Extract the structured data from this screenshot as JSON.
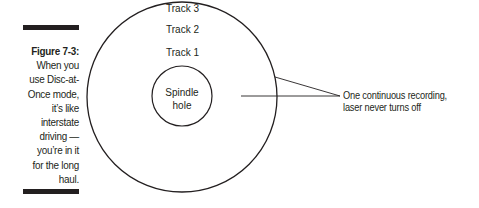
{
  "caption": {
    "figure_label": "Figure 7-3:",
    "text": "When you use Disc-at-Once mode, it’s like interstate driving — you’re in it for the long haul.",
    "lines": [
      "When you",
      "use Disc-at-",
      "Once mode,",
      "it’s like",
      "interstate",
      "driving —",
      "you’re in it",
      "for the long",
      "haul."
    ]
  },
  "diagram": {
    "tracks": [
      {
        "label": "Track 3"
      },
      {
        "label": "Track 2"
      },
      {
        "label": "Track 1"
      }
    ],
    "spindle_label_line1": "Spindle",
    "spindle_label_line2": "hole",
    "callout_line1": "One continuous recording,",
    "callout_line2": "laser never turns off"
  }
}
